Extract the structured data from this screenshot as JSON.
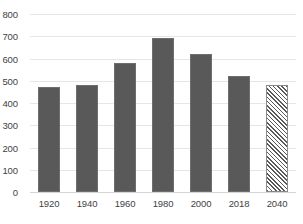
{
  "chart_data": {
    "type": "bar",
    "title": "",
    "subtitle": "",
    "xlabel": "",
    "ylabel": "",
    "categories": [
      "1920",
      "1940",
      "1960",
      "1980",
      "2000",
      "2018",
      "2040"
    ],
    "values": [
      470,
      480,
      580,
      690,
      620,
      520,
      480
    ],
    "series": [
      {
        "name": "",
        "values": [
          470,
          480,
          580,
          690,
          620,
          520,
          480
        ],
        "styles": [
          "solid",
          "solid",
          "solid",
          "solid",
          "solid",
          "solid",
          "hatched"
        ]
      }
    ],
    "ylim": [
      0,
      800
    ],
    "y_ticks": [
      0,
      100,
      200,
      300,
      400,
      500,
      600,
      700,
      800
    ],
    "y_tick_labels": [
      "0",
      "100",
      "200",
      "300",
      "400",
      "500",
      "600",
      "700",
      "800"
    ],
    "grid": "horizontal",
    "legend": "none",
    "annotations": [],
    "colors": {
      "bar_fill": "#595959",
      "bar_border": "#6e6e6e",
      "forecast_fill": "#ffffff",
      "forecast_hatch": "#595959",
      "gridline": "#e6e6e6",
      "axis_line": "#d4d4d4",
      "tick_text": "#3f3f3f",
      "background": "#ffffff"
    }
  }
}
